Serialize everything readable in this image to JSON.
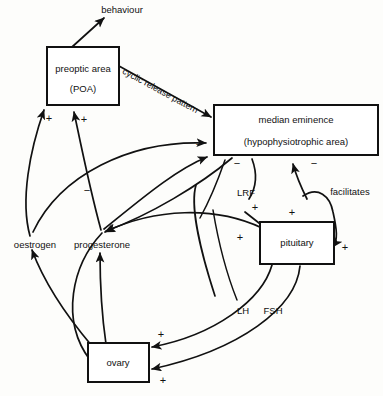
{
  "diagram": {
    "background_color": "#fdfdfb",
    "line_color": "#111111",
    "box_fill": "#ffffff",
    "nodes": [
      {
        "id": "poa",
        "label_line1": "preoptic area",
        "label_line2": "(POA)",
        "shape": "box"
      },
      {
        "id": "median_eminence",
        "label_line1": "median eminence",
        "label_line2": "(hypophysiotrophic area)",
        "shape": "box"
      },
      {
        "id": "pituitary",
        "label_line1": "pituitary",
        "shape": "box"
      },
      {
        "id": "ovary",
        "label_line1": "ovary",
        "shape": "box"
      }
    ],
    "free_labels": [
      {
        "id": "behaviour",
        "text": "behaviour"
      },
      {
        "id": "oestrogen",
        "text": "oestrogen"
      },
      {
        "id": "progesterone",
        "text": "progesterone"
      },
      {
        "id": "lrf",
        "text": "LRF"
      },
      {
        "id": "facilitates",
        "text": "facilitates"
      },
      {
        "id": "lh",
        "text": "LH"
      },
      {
        "id": "fsh",
        "text": "FSH"
      },
      {
        "id": "cyclic_release_pattern",
        "text": "cyclic release pattern"
      }
    ],
    "signs": [
      {
        "id": "sign-poa-oestrogen",
        "text": "+"
      },
      {
        "id": "sign-poa-progesterone",
        "text": "+"
      },
      {
        "id": "sign-me-poa",
        "text": "−"
      },
      {
        "id": "sign-me-left",
        "text": "−"
      },
      {
        "id": "sign-me-mid",
        "text": "−"
      },
      {
        "id": "sign-me-right",
        "text": "−"
      },
      {
        "id": "sign-mid-left",
        "text": "−"
      },
      {
        "id": "sign-pituitary-lrf",
        "text": "+"
      },
      {
        "id": "sign-pituitary-upperleft",
        "text": "+"
      },
      {
        "id": "sign-pituitary-left",
        "text": "+"
      },
      {
        "id": "sign-pituitary-facilitates",
        "text": "+"
      },
      {
        "id": "sign-ovary-lh",
        "text": "+"
      },
      {
        "id": "sign-ovary-fsh",
        "text": "+"
      }
    ]
  }
}
